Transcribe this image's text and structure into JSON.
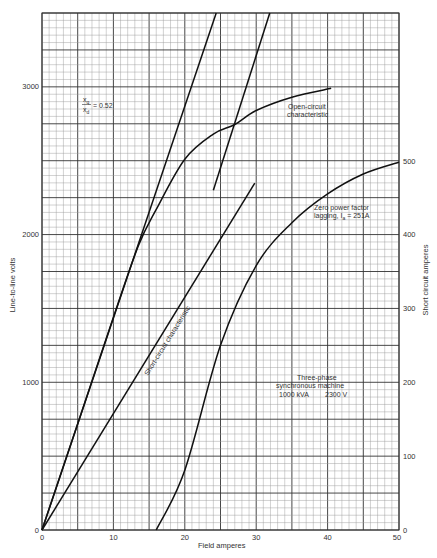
{
  "chart_data": {
    "type": "line",
    "title": "",
    "xlabel": "Field amperes",
    "ylabel": "Line-to-line volts",
    "y2label": "Short circuit amperes",
    "xlim": [
      0,
      50
    ],
    "ylim": [
      0,
      3500
    ],
    "y2lim": [
      0,
      500
    ],
    "grid": true,
    "x_ticks": [
      0,
      10,
      20,
      30,
      40,
      50
    ],
    "y_ticks": [
      0,
      1000,
      2000,
      3000
    ],
    "y2_ticks": [
      0,
      100,
      200,
      300,
      400,
      500
    ],
    "series": [
      {
        "name": "Open-circuit characteristic",
        "axis": "left",
        "x": [
          0,
          5,
          10,
          13.5,
          16,
          20,
          24,
          27,
          30,
          35,
          40.5
        ],
        "y": [
          0,
          720,
          1440,
          1925,
          2170,
          2510,
          2680,
          2745,
          2840,
          2930,
          2990
        ]
      },
      {
        "name": "Air-gap line",
        "axis": "left",
        "x": [
          0,
          24.4
        ],
        "y": [
          0,
          3500
        ]
      },
      {
        "name": "Potier line",
        "axis": "left",
        "x": [
          24,
          31.9
        ],
        "y": [
          2300,
          3500
        ]
      },
      {
        "name": "Short-circuit characteristic",
        "axis": "right",
        "x": [
          0,
          29.8
        ],
        "y": [
          0,
          470
        ]
      },
      {
        "name": "Zero power factor lagging, Ia = 251A",
        "axis": "left",
        "x": [
          16,
          20,
          25,
          30,
          35,
          40,
          45,
          50
        ],
        "y": [
          0,
          405,
          1250,
          1790,
          2080,
          2275,
          2410,
          2490
        ]
      }
    ],
    "annotations": [
      "xq/xd = 0.52",
      "Open-circuit characteristic",
      "Short-circuit characteristic",
      "Zero power factor lagging, Ia = 251A",
      "Three-phase synchronous machine 1000 kVA 2300 V"
    ]
  },
  "labels": {
    "x_axis_title": "Field amperes",
    "y_axis_title": "Line-to-line volts",
    "y2_axis_title": "Short circuit amperes",
    "ratio_num": "x",
    "ratio_num_sub": "q",
    "ratio_den": "x",
    "ratio_den_sub": "d",
    "ratio_value": "= 0.52",
    "occ_line1": "Open-circuit",
    "occ_line2": "characteristic",
    "scc_label": "Short-circuit characteristic",
    "zpf_line1": "Zero power factor",
    "zpf_line2": "lagging, I",
    "zpf_sub": "a",
    "zpf_line2b": " = 251A",
    "machine_line1": "Three-phase",
    "machine_line2": "synchronous machine",
    "machine_line3a": "1000 kVA",
    "machine_line3b": "2300 V",
    "x_ticks": [
      "0",
      "10",
      "20",
      "30",
      "40",
      "50"
    ],
    "y_ticks": [
      "0",
      "1000",
      "2000",
      "3000"
    ],
    "y2_ticks": [
      "0",
      "100",
      "200",
      "300",
      "400",
      "500"
    ]
  },
  "colors": {
    "grid_minor": "#9a9a9a",
    "grid_major": "#333333",
    "curve": "#111111"
  }
}
